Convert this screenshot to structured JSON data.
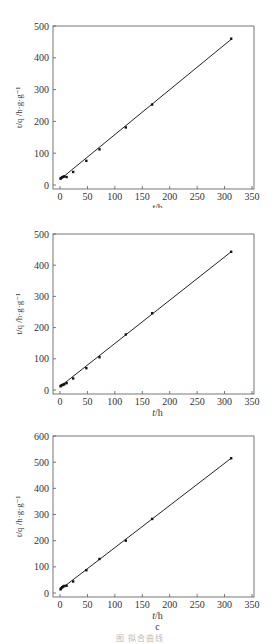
{
  "figure": {
    "caption": "图  拟合曲线"
  },
  "chart_data": [
    {
      "type": "scatter",
      "panel_label": "a",
      "title": "",
      "xlabel": "t/h",
      "ylabel": "t/q /h·g·g⁻¹",
      "xlim": [
        0,
        350
      ],
      "ylim": [
        0,
        500
      ],
      "xticks": [
        0,
        50,
        100,
        150,
        200,
        250,
        300,
        350
      ],
      "yticks": [
        0,
        100,
        200,
        300,
        400,
        500
      ],
      "grid": false,
      "series": [
        {
          "name": "data",
          "x": [
            1,
            2,
            4,
            6,
            8,
            12,
            24,
            48,
            72,
            120,
            168,
            312
          ],
          "y": [
            20,
            22,
            24,
            26,
            27,
            25,
            41,
            76,
            112,
            181,
            253,
            460
          ]
        },
        {
          "name": "linear fit",
          "x": [
            2,
            312
          ],
          "y": [
            20,
            458
          ]
        }
      ]
    },
    {
      "type": "scatter",
      "panel_label": "b",
      "title": "",
      "xlabel": "t/h",
      "ylabel": "t/q /h·g·g⁻¹",
      "xlim": [
        0,
        350
      ],
      "ylim": [
        0,
        500
      ],
      "xticks": [
        0,
        50,
        100,
        150,
        200,
        250,
        300,
        350
      ],
      "yticks": [
        0,
        100,
        200,
        300,
        400,
        500
      ],
      "grid": false,
      "series": [
        {
          "name": "data",
          "x": [
            1,
            2,
            4,
            6,
            8,
            12,
            24,
            48,
            72,
            120,
            168,
            312
          ],
          "y": [
            12,
            14,
            16,
            17,
            19,
            22,
            37,
            70,
            105,
            178,
            246,
            443
          ]
        },
        {
          "name": "linear fit",
          "x": [
            1,
            312
          ],
          "y": [
            12,
            443
          ]
        }
      ]
    },
    {
      "type": "scatter",
      "panel_label": "c",
      "title": "",
      "xlabel": "t/h",
      "ylabel": "t/q /h·g·g⁻¹",
      "xlim": [
        0,
        350
      ],
      "ylim": [
        0,
        600
      ],
      "xticks": [
        0,
        50,
        100,
        150,
        200,
        250,
        300,
        350
      ],
      "yticks": [
        0,
        100,
        200,
        300,
        400,
        500,
        600
      ],
      "grid": false,
      "series": [
        {
          "name": "data",
          "x": [
            1,
            2,
            4,
            6,
            8,
            12,
            24,
            48,
            72,
            120,
            168,
            312
          ],
          "y": [
            14,
            18,
            22,
            25,
            27,
            28,
            44,
            87,
            130,
            200,
            283,
            515
          ]
        },
        {
          "name": "linear fit",
          "x": [
            1,
            312
          ],
          "y": [
            14,
            515
          ]
        }
      ]
    }
  ]
}
